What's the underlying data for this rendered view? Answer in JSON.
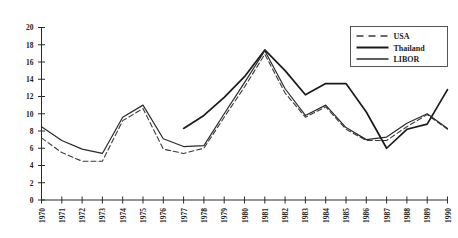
{
  "chart_data": {
    "type": "line",
    "title": "",
    "subtitle": "",
    "xlabel": "",
    "ylabel": "",
    "xlim": [
      1970,
      1990
    ],
    "ylim": [
      0,
      20
    ],
    "ytick_step": 2,
    "grid": false,
    "legend_position": "top-right",
    "x": [
      1970,
      1971,
      1972,
      1973,
      1974,
      1975,
      1976,
      1977,
      1978,
      1979,
      1980,
      1981,
      1982,
      1983,
      1984,
      1985,
      1986,
      1987,
      1988,
      1989,
      1990
    ],
    "yticks": [
      0,
      2,
      4,
      6,
      8,
      10,
      12,
      14,
      16,
      18,
      20
    ],
    "xticklabels": [
      "1970",
      "1971",
      "1972",
      "1973",
      "1974",
      "1975",
      "1976",
      "1977",
      "1978",
      "1979",
      "1980",
      "1981",
      "1982",
      "1983",
      "1984",
      "1985",
      "1986",
      "1987",
      "1988",
      "1989",
      "1990"
    ],
    "series": [
      {
        "name": "USA",
        "style": "dashed",
        "color": "#3a3a3a",
        "width": 1.1,
        "x": [
          1970,
          1971,
          1972,
          1973,
          1974,
          1975,
          1976,
          1977,
          1978,
          1979,
          1980,
          1981,
          1982,
          1983,
          1984,
          1985,
          1986,
          1987,
          1988,
          1989,
          1990
        ],
        "values": [
          7.2,
          5.5,
          4.5,
          4.5,
          9.2,
          10.6,
          5.9,
          5.4,
          6.0,
          9.6,
          13.1,
          16.9,
          12.4,
          9.6,
          10.8,
          8.2,
          6.9,
          6.9,
          8.5,
          9.9,
          8.2
        ]
      },
      {
        "name": "Thailand",
        "style": "solid",
        "color": "#1a1a1a",
        "width": 1.7,
        "x": [
          1977,
          1978,
          1979,
          1980,
          1981,
          1982,
          1983,
          1984,
          1985,
          1986,
          1987,
          1988,
          1989,
          1990
        ],
        "values": [
          8.3,
          9.8,
          11.9,
          14.3,
          17.4,
          15.0,
          12.2,
          13.5,
          13.5,
          10.2,
          6.0,
          8.2,
          8.8,
          12.8
        ]
      },
      {
        "name": "LIBOR",
        "style": "solid",
        "color": "#2a2a2a",
        "width": 1.2,
        "x": [
          1970,
          1971,
          1972,
          1973,
          1974,
          1975,
          1976,
          1977,
          1978,
          1979,
          1980,
          1981,
          1982,
          1983,
          1984,
          1985,
          1986,
          1987,
          1988,
          1989,
          1990
        ],
        "values": [
          8.5,
          6.9,
          5.9,
          5.4,
          9.6,
          11.0,
          7.1,
          6.2,
          6.3,
          10.0,
          13.6,
          17.3,
          12.9,
          9.8,
          11.0,
          8.4,
          7.0,
          7.3,
          8.9,
          10.0,
          8.3
        ]
      }
    ]
  },
  "legend": {
    "entries": [
      {
        "label": "USA"
      },
      {
        "label": "Thailand"
      },
      {
        "label": "LIBOR"
      }
    ]
  },
  "axis": {
    "axis_color": "#2b2b2b"
  }
}
